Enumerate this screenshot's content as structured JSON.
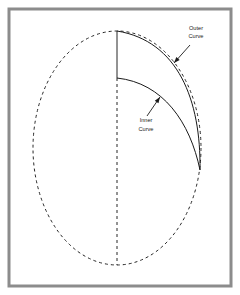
{
  "figure": {
    "background_color": "#ffffff",
    "frame": {
      "name": "outer-frame",
      "color": "#8c8c8c",
      "inner_color": "#ffffff",
      "x": 9,
      "y": 9,
      "width": 222,
      "height": 277,
      "stroke_width": 3
    },
    "ellipse": {
      "name": "dashed-ellipse",
      "center_x": 117,
      "center_y": 148,
      "radius_x": 84,
      "radius_y": 117,
      "stroke_color": "#262626",
      "stroke_width": 1,
      "dash_pattern": "3,3",
      "style": "dashed"
    },
    "axis": {
      "name": "vertical-center-axis",
      "x": 117,
      "solid_top_y": 31,
      "solid_bottom_y": 78,
      "dashed_bottom_y": 265,
      "stroke_color": "#262626",
      "stroke_width": 1,
      "dash_pattern": "3,3"
    },
    "curves": [
      {
        "id": "outer",
        "label_line1": "Outer",
        "label_line2": "Curve",
        "start_x": 117,
        "start_y": 31,
        "end_x": 200,
        "end_y": 170,
        "control1_x": 178,
        "control1_y": 41,
        "control2_x": 201,
        "control2_y": 100,
        "stroke_color": "#1a1a1a",
        "stroke_width": 1,
        "style": "solid",
        "label_x": 196,
        "label_y1": 30,
        "label_y2": 38,
        "arrow_from_x": 190,
        "arrow_from_y": 45,
        "arrow_to_x": 174,
        "arrow_to_y": 63
      },
      {
        "id": "inner",
        "label_line1": "Inner",
        "label_line2": "Curve",
        "start_x": 117,
        "start_y": 78,
        "end_x": 200,
        "end_y": 170,
        "control1_x": 163,
        "control1_y": 83,
        "control2_x": 190,
        "control2_y": 122,
        "stroke_color": "#1a1a1a",
        "stroke_width": 1,
        "style": "solid",
        "label_x": 146,
        "label_y1": 122,
        "label_y2": 131,
        "arrow_from_x": 147,
        "arrow_from_y": 116,
        "arrow_to_x": 160,
        "arrow_to_y": 97
      }
    ]
  }
}
